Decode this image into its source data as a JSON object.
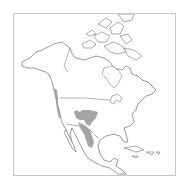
{
  "map": {
    "region": "North America",
    "type": "species range map",
    "colors": {
      "background": "#ffffff",
      "land": "#ffffff",
      "outline": "#555555",
      "range": "#9a9a9a",
      "frame": "#c8c8c8"
    },
    "range_areas": [
      {
        "name": "pacific-coast-strip",
        "description": "Narrow band along Pacific coast from British Columbia to California"
      },
      {
        "name": "southwest-interior",
        "description": "Arizona / New Mexico region"
      },
      {
        "name": "sierra-madre-occidental",
        "description": "Band running south through western Mexico"
      }
    ]
  }
}
